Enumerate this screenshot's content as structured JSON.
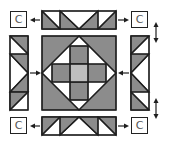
{
  "diagram": {
    "corner_label": "C",
    "corners": [
      {
        "id": "top-left",
        "label": "C"
      },
      {
        "id": "top-right",
        "label": "C"
      },
      {
        "id": "bottom-left",
        "label": "C"
      },
      {
        "id": "bottom-right",
        "label": "C"
      }
    ],
    "units": [
      "top-strip",
      "left-strip",
      "center-block",
      "right-strip",
      "bottom-strip"
    ],
    "arrows": [
      {
        "from": "top-left-corner",
        "direction": "left"
      },
      {
        "from": "top-right-corner",
        "direction": "right"
      },
      {
        "from": "bottom-left-corner",
        "direction": "left"
      },
      {
        "from": "bottom-right-corner",
        "direction": "right"
      },
      {
        "from": "left-strip",
        "direction": "right"
      },
      {
        "from": "right-strip",
        "direction": "left"
      },
      {
        "type": "double-vertical",
        "position": "upper-right"
      },
      {
        "type": "double-vertical",
        "position": "lower-right"
      }
    ],
    "colors": {
      "dark": "#8c8c8c",
      "light": "#bebebe",
      "white": "#ffffff",
      "line": "#1e1e1e"
    }
  }
}
